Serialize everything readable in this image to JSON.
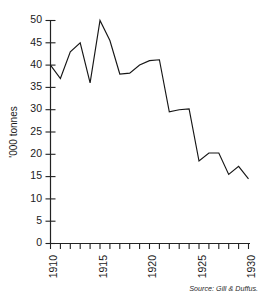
{
  "chart_data": {
    "type": "line",
    "title": "",
    "subtitle": "",
    "xlabel": "",
    "ylabel": "'000 tonnes",
    "xlim": [
      1910,
      1930
    ],
    "ylim": [
      0,
      50
    ],
    "grid": false,
    "legend": null,
    "source_note": "Source: Gill & Duffus.",
    "x": [
      1910,
      1911,
      1912,
      1913,
      1914,
      1915,
      1916,
      1917,
      1918,
      1919,
      1920,
      1921,
      1922,
      1923,
      1924,
      1925,
      1926,
      1927,
      1928,
      1929,
      1930
    ],
    "values": [
      40,
      37,
      43,
      45,
      36,
      50,
      45.5,
      38,
      38.2,
      40,
      41,
      41.2,
      29.5,
      30,
      30.2,
      18.5,
      20.3,
      20.3,
      15.5,
      17.3,
      14.5
    ],
    "series": [
      {
        "name": "'000 tonnes",
        "color": "#161616",
        "values": [
          40,
          37,
          43,
          45,
          36,
          50,
          45.5,
          38,
          38.2,
          40,
          41,
          41.2,
          29.5,
          30,
          30.2,
          18.5,
          20.3,
          20.3,
          15.5,
          17.3,
          14.5
        ]
      }
    ],
    "y_ticks": [
      0,
      5,
      10,
      15,
      20,
      25,
      30,
      35,
      40,
      45,
      50
    ],
    "y_tick_labels": [
      "0",
      "5",
      "10",
      "15",
      "20",
      "25",
      "30",
      "35",
      "40",
      "45",
      "50"
    ],
    "x_ticks": [
      1910,
      1911,
      1912,
      1913,
      1914,
      1915,
      1916,
      1917,
      1918,
      1919,
      1920,
      1921,
      1922,
      1923,
      1924,
      1925,
      1926,
      1927,
      1928,
      1929,
      1930
    ],
    "x_tick_labels_shown": [
      "1910",
      "1915",
      "1920",
      "1925",
      "1930"
    ],
    "x_labeled_ticks": [
      1910,
      1915,
      1920,
      1925,
      1930
    ]
  },
  "labels": {
    "y": {
      "t0": "0",
      "t5": "5",
      "t10": "10",
      "t15": "15",
      "t20": "20",
      "t25": "25",
      "t30": "30",
      "t35": "35",
      "t40": "40",
      "t45": "45",
      "t50": "50"
    },
    "x": {
      "x1910": "1910",
      "x1915": "1915",
      "x1920": "1920",
      "x1925": "1925",
      "x1930": "1930"
    },
    "axis_title_y": "'000 tonnes",
    "source": "Source: Gill & Duffus."
  }
}
